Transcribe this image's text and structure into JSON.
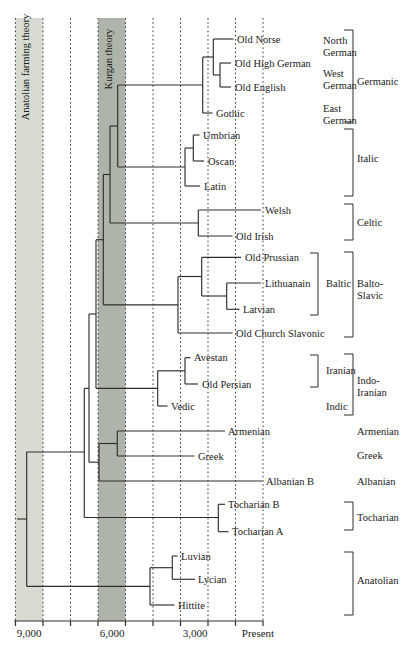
{
  "figure": {
    "width": 412,
    "height": 650,
    "colors": {
      "background": "#ffffff",
      "band_light": "#d8dbd1",
      "band_dark": "#afb4aa",
      "tree_line": "#2e2e2e",
      "gridline": "#3a3a3a",
      "text": "#1a1a1a"
    },
    "plot_top": 18,
    "bands": [
      {
        "label": "Anatolian farming theory",
        "shade": "light",
        "x1": 15.5,
        "x2": 43,
        "label_x": 29,
        "label_y": 67
      },
      {
        "label": "Kurgan theory",
        "shade": "dark",
        "x1": 98,
        "x2": 125.5,
        "label_x": 112,
        "label_y": 59
      }
    ],
    "gridlines_x": [
      15.5,
      43,
      70.5,
      98,
      125.5,
      153,
      180.5,
      208,
      235.5,
      263
    ],
    "axis": {
      "y": 621,
      "x1": 14,
      "x2": 263.5,
      "tick_len": 5,
      "label_y": 637,
      "labels": [
        {
          "text": "9,000",
          "x": 29
        },
        {
          "text": "6,000",
          "x": 112
        },
        {
          "text": "3,000",
          "x": 195
        },
        {
          "text": "Present",
          "x": 258
        }
      ]
    }
  },
  "tree": {
    "h_lines": [
      [
        39,
        213.3,
        233.5
      ],
      [
        63,
        220,
        231
      ],
      [
        87,
        220,
        231
      ],
      [
        75,
        213.3,
        220
      ],
      [
        57,
        202.7,
        213.3
      ],
      [
        113,
        202.7,
        212.5
      ],
      [
        85,
        117.7,
        202.7
      ],
      [
        135,
        193.3,
        199.5
      ],
      [
        161,
        193.3,
        204
      ],
      [
        148,
        185,
        193.3
      ],
      [
        186,
        185,
        200
      ],
      [
        167,
        117.7,
        185
      ],
      [
        126,
        110,
        117.7
      ],
      [
        210,
        198.3,
        261
      ],
      [
        236,
        198.3,
        232.5
      ],
      [
        223,
        110,
        198.3
      ],
      [
        174.5,
        103.3,
        110
      ],
      [
        257.3,
        201.7,
        241
      ],
      [
        283,
        226.7,
        261
      ],
      [
        309.3,
        226.7,
        239.5
      ],
      [
        296,
        201.7,
        226.7
      ],
      [
        276.5,
        178,
        201.7
      ],
      [
        333,
        178,
        232.5
      ],
      [
        304.8,
        103.3,
        178
      ],
      [
        239.7,
        96,
        103.3
      ],
      [
        357.7,
        185,
        190.5
      ],
      [
        384,
        185,
        198
      ],
      [
        370.8,
        157.7,
        185
      ],
      [
        406,
        157.7,
        167.5
      ],
      [
        388.3,
        96,
        157.7
      ],
      [
        314,
        89,
        96
      ],
      [
        431,
        117.3,
        225
      ],
      [
        456,
        117.3,
        194.5
      ],
      [
        443.5,
        99,
        117.3
      ],
      [
        481,
        99,
        262.5
      ],
      [
        462.2,
        89,
        99
      ],
      [
        388.3,
        84.3,
        89
      ],
      [
        504.3,
        218.3,
        225
      ],
      [
        531.7,
        218.3,
        228.5
      ],
      [
        517.5,
        84.3,
        218.3
      ],
      [
        452,
        26.7,
        84.3
      ],
      [
        556,
        172.3,
        177.5
      ],
      [
        579.3,
        172.3,
        195
      ],
      [
        567.7,
        150,
        172.3
      ],
      [
        605,
        150,
        174.5
      ],
      [
        586.3,
        26.7,
        150
      ],
      [
        519,
        17,
        26.7
      ]
    ],
    "v_lines": [
      [
        220,
        63,
        87
      ],
      [
        213.3,
        39,
        75
      ],
      [
        202.7,
        57,
        113
      ],
      [
        193.3,
        135,
        161
      ],
      [
        185,
        148,
        186
      ],
      [
        117.7,
        85,
        167
      ],
      [
        198.3,
        210,
        236
      ],
      [
        110,
        126,
        223
      ],
      [
        226.7,
        283,
        309.3
      ],
      [
        201.7,
        257.3,
        296
      ],
      [
        178,
        276.5,
        333
      ],
      [
        103.3,
        174.5,
        304.8
      ],
      [
        185,
        357.7,
        384
      ],
      [
        157.7,
        370.8,
        406
      ],
      [
        96,
        239.7,
        388.3
      ],
      [
        117.3,
        431,
        456
      ],
      [
        99,
        443.5,
        481
      ],
      [
        89,
        314,
        462.2
      ],
      [
        84.3,
        388.3,
        517.5
      ],
      [
        218.3,
        504.3,
        531.7
      ],
      [
        172.3,
        556,
        579.3
      ],
      [
        150,
        567.7,
        605
      ],
      [
        26.7,
        452,
        586.3
      ]
    ],
    "leaves": [
      {
        "label": "Old Norse",
        "x": 237,
        "y": 39
      },
      {
        "label": "Old High German",
        "x": 235,
        "y": 63
      },
      {
        "label": "Old English",
        "x": 235,
        "y": 87
      },
      {
        "label": "Gothic",
        "x": 216,
        "y": 113
      },
      {
        "label": "Umbrian",
        "x": 203,
        "y": 135
      },
      {
        "label": "Oscan",
        "x": 208,
        "y": 161
      },
      {
        "label": "Latin",
        "x": 204,
        "y": 186
      },
      {
        "label": "Welsh",
        "x": 265,
        "y": 210
      },
      {
        "label": "Old Irish",
        "x": 236,
        "y": 236
      },
      {
        "label": "Old Prussian",
        "x": 245,
        "y": 257.3
      },
      {
        "label": "Lithuanain",
        "x": 265,
        "y": 283
      },
      {
        "label": "Latvian",
        "x": 243,
        "y": 309.3
      },
      {
        "label": "Old Church Slavonic",
        "x": 236,
        "y": 333
      },
      {
        "label": "Avestan",
        "x": 194,
        "y": 357.7
      },
      {
        "label": "Old Persian",
        "x": 202,
        "y": 384
      },
      {
        "label": "Vedic",
        "x": 171,
        "y": 406
      },
      {
        "label": "Armenian",
        "x": 228,
        "y": 431
      },
      {
        "label": "Greek",
        "x": 198,
        "y": 456
      },
      {
        "label": "Albanian B",
        "x": 266,
        "y": 481
      },
      {
        "label": "Tocharian B",
        "x": 228,
        "y": 504.3
      },
      {
        "label": "Tocharian A",
        "x": 232,
        "y": 531.7
      },
      {
        "label": "Luvian",
        "x": 181,
        "y": 556
      },
      {
        "label": "Lycian",
        "x": 198,
        "y": 579.3
      },
      {
        "label": "Hittite",
        "x": 178,
        "y": 605
      }
    ]
  },
  "groups": {
    "sub_labels": [
      {
        "lines": [
          "North",
          "German"
        ],
        "x": 323,
        "y": 46
      },
      {
        "lines": [
          "West",
          "German"
        ],
        "x": 323,
        "y": 79
      },
      {
        "lines": [
          "East",
          "German"
        ],
        "x": 323,
        "y": 114.5
      },
      {
        "lines": [
          "Baltic"
        ],
        "x": 326,
        "y": 283
      },
      {
        "lines": [
          "Iranian"
        ],
        "x": 326,
        "y": 370
      },
      {
        "lines": [
          "Indic"
        ],
        "x": 326,
        "y": 406
      }
    ],
    "family_labels": [
      {
        "lines": [
          "Germanic"
        ],
        "x": 357,
        "y": 81
      },
      {
        "lines": [
          "Italic"
        ],
        "x": 357,
        "y": 158
      },
      {
        "lines": [
          "Celtic"
        ],
        "x": 357,
        "y": 222
      },
      {
        "lines": [
          "Balto-",
          "Slavic"
        ],
        "x": 357,
        "y": 289
      },
      {
        "lines": [
          "Indo-",
          "Iranian"
        ],
        "x": 357,
        "y": 386
      },
      {
        "lines": [
          "Armenian"
        ],
        "x": 357,
        "y": 431
      },
      {
        "lines": [
          "Greek"
        ],
        "x": 357,
        "y": 455
      },
      {
        "lines": [
          "Albanian"
        ],
        "x": 357,
        "y": 481
      },
      {
        "lines": [
          "Tocharian"
        ],
        "x": 357,
        "y": 517
      },
      {
        "lines": [
          "Anatolian"
        ],
        "x": 357,
        "y": 580
      }
    ],
    "brackets": [
      {
        "name": "germanic",
        "x": 353,
        "y1": 30,
        "y2": 122,
        "cap": 9
      },
      {
        "name": "italic",
        "x": 353,
        "y1": 129,
        "y2": 196,
        "cap": 9
      },
      {
        "name": "celtic",
        "x": 353,
        "y1": 204,
        "y2": 240,
        "cap": 9
      },
      {
        "name": "baltic",
        "x": 318,
        "y1": 253,
        "y2": 315,
        "cap": 8
      },
      {
        "name": "balto-slavic",
        "x": 353,
        "y1": 252,
        "y2": 337,
        "cap": 9
      },
      {
        "name": "iranian",
        "x": 318,
        "y1": 355,
        "y2": 387,
        "cap": 8
      },
      {
        "name": "indo-iranian",
        "x": 353,
        "y1": 354,
        "y2": 415,
        "cap": 9
      },
      {
        "name": "tocharian",
        "x": 353,
        "y1": 502,
        "y2": 530,
        "cap": 9
      },
      {
        "name": "anatolian",
        "x": 353,
        "y1": 552,
        "y2": 615,
        "cap": 9
      }
    ]
  }
}
